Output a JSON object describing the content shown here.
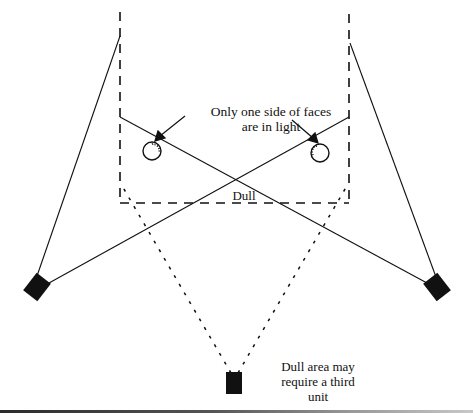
{
  "diagram": {
    "labels": {
      "faces_line1": "Only one side of faces",
      "faces_line2": "are in light",
      "dull": "Dull",
      "third_line1": "Dull area may",
      "third_line2": "require a third",
      "third_line3": "unit"
    },
    "elements": {
      "lights": [
        {
          "name": "left-light-unit",
          "x": 37,
          "y": 285
        },
        {
          "name": "right-light-unit",
          "x": 437,
          "y": 285
        },
        {
          "name": "third-light-unit",
          "x": 234,
          "y": 381
        }
      ],
      "faces": [
        {
          "name": "left-face",
          "x": 152,
          "y": 150,
          "r": 9
        },
        {
          "name": "right-face",
          "x": 320,
          "y": 152,
          "r": 9
        }
      ],
      "coverage_frame": {
        "left": 120,
        "right": 349,
        "top": 10,
        "bottom": 203
      }
    },
    "colors": {
      "ink": "#111111",
      "background": "#ffffff"
    }
  }
}
